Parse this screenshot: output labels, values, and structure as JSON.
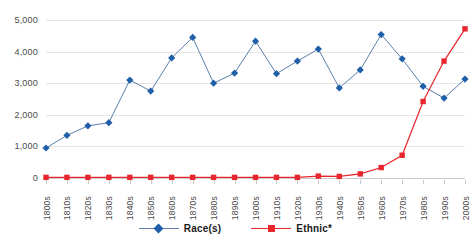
{
  "chart_data": {
    "type": "line",
    "title": "",
    "xlabel": "",
    "ylabel": "",
    "ylim": [
      0,
      5000
    ],
    "ytick_step": 1000,
    "grid": true,
    "legend_position": "bottom",
    "categories": [
      "1800s",
      "1810s",
      "1820s",
      "1830s",
      "1840s",
      "1850s",
      "1860s",
      "1870s",
      "1880s",
      "1890s",
      "1900s",
      "1910s",
      "1920s",
      "1930s",
      "1940s",
      "1950s",
      "1960s",
      "1970s",
      "1980s",
      "1990s",
      "2000s"
    ],
    "ytick_labels": [
      "0",
      "1,000",
      "2,000",
      "3,000",
      "4,000",
      "5,000"
    ],
    "ytick_values": [
      0,
      1000,
      2000,
      3000,
      4000,
      5000
    ],
    "series": [
      {
        "name": "Race(s)",
        "color": "#1F5FA9",
        "marker": "diamond",
        "values": [
          950,
          1350,
          1650,
          1750,
          3100,
          2750,
          3800,
          4450,
          3000,
          3320,
          4330,
          3300,
          3700,
          4080,
          2850,
          3420,
          4540,
          3770,
          2900,
          2530,
          3130
        ]
      },
      {
        "name": "Ethnic*",
        "color": "#E8262D",
        "marker": "square",
        "values": [
          20,
          20,
          20,
          20,
          20,
          20,
          20,
          20,
          20,
          20,
          20,
          20,
          20,
          60,
          50,
          130,
          330,
          720,
          2420,
          3700,
          4720
        ]
      }
    ]
  },
  "legend": {
    "items": [
      {
        "label": "Race(s)",
        "color": "#1F5FA9",
        "marker": "diamond"
      },
      {
        "label": "Ethnic*",
        "color": "#E8262D",
        "marker": "square"
      }
    ]
  }
}
